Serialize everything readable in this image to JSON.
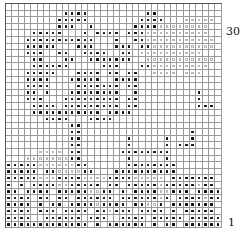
{
  "chart": {
    "columns": 34,
    "rows": 34,
    "legend": {
      "dark": "#",
      "light": "o",
      "empty": "."
    },
    "row_labels": [
      {
        "label": "30",
        "row_from_bottom": 30
      },
      {
        "label": "1",
        "row_from_bottom": 1
      }
    ],
    "pattern": [
      "..................................",
      ".........####.........##..........",
      "........#####........####...ooooo.",
      "........###..#......####oooooooo..",
      "....#####...#.####.###oooooooooo..",
      "...###########...#..##ooooooooooo.",
      "...#####...###...###.##oooooooooo.",
      "...###..##..####..##.oooooooooo...",
      "....##...##..#######..ooooooooooo.",
      "....######.....###...##ooooooooo..",
      "...#####...####.##.##..oooo.ooo...",
      "...####...#####..####.............",
      "...####....#######.##.............",
      "...##.#...########..#.........#...",
      "...###...#########.##.........#...",
      "....####.#########.##.........###.",
      "....###########.####..............",
      "......####...####.................",
      "..........##......................",
      "..........##.................#....",
      "..........##.......#.....#...#....",
      "..........##.......#.....#.###....",
      ".....oooo.##......########........",
      "...ooooooo##.......#.....#........",
      "#####oooooo##......########........",
      "#####.##oooo##...##########.......",
      "#####ooo####oooo####ooooo.#######.",
      "#.#.####oo#####.##.#####o#####o##.",
      "##.####.#####oo##.#.####oo###.####",
      "####.##.##.######.######o#.####o##",
      "####.#.##.####o####.##oo#.#######.",
      "####.###.####.##o###.####.#.#####.",
      "####..######.###..####.#####.#####",
      "#############.#.######.#.##.######"
    ]
  }
}
